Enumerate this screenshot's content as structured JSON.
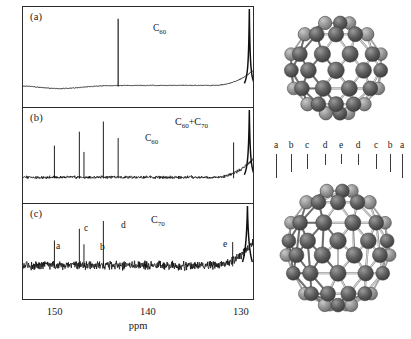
{
  "figure": {
    "caption_panels": [
      "(a)",
      "(b)",
      "(c)"
    ],
    "axis": {
      "label": "ppm",
      "ticks": [
        150,
        140,
        130
      ],
      "range_left_ppm": 153.5,
      "range_right_ppm": 128.6,
      "direction": "decreasing-left-to-right"
    }
  },
  "panels": [
    {
      "id": "a",
      "tag": "(a)",
      "species_label": "C",
      "species_sub": "60",
      "annotations": [
        {
          "text": "C",
          "sub": "60",
          "ppm": 143.2
        }
      ],
      "description": "Single sharp C60 resonance on flat baseline"
    },
    {
      "id": "b",
      "tag": "(b)",
      "species_label": "C",
      "species_sub": "60",
      "species_label2": "C",
      "species_sub2": "70",
      "annotations": [
        {
          "text": "C",
          "sub": "60",
          "ppm": 143.2
        }
      ],
      "description": "Mixture of C60 and C70 showing multiple resonances"
    },
    {
      "id": "c",
      "tag": "(c)",
      "species_label": "C",
      "species_sub": "70",
      "annotations": [
        {
          "text": "a",
          "ppm": 150.1
        },
        {
          "text": "c",
          "ppm": 147.4
        },
        {
          "text": "b",
          "ppm": 146.9
        },
        {
          "text": "d",
          "ppm": 144.8
        },
        {
          "text": "e",
          "ppm": 130.8
        }
      ],
      "description": "C70 spectrum with five inequivalent carbon sites a-e"
    }
  ],
  "chart_data": {
    "type": "line",
    "title": "",
    "xlabel": "ppm",
    "ylabel": "",
    "xlim": [
      153.5,
      128.6
    ],
    "grid": false,
    "legend": "none",
    "panels": [
      {
        "name": "(a) C60",
        "peaks": [
          {
            "ppm": 143.2,
            "height": 0.92,
            "label": "C60"
          },
          {
            "ppm": 129.0,
            "height": 1.0,
            "label": "solvent"
          }
        ],
        "baseline_noise": 0.03
      },
      {
        "name": "(b) C60+C70",
        "peaks": [
          {
            "ppm": 150.1,
            "height": 0.5,
            "label": "a"
          },
          {
            "ppm": 147.4,
            "height": 0.72,
            "label": "c"
          },
          {
            "ppm": 146.9,
            "height": 0.4,
            "label": "b"
          },
          {
            "ppm": 144.8,
            "height": 0.88,
            "label": "d"
          },
          {
            "ppm": 143.2,
            "height": 0.62,
            "label": "C60"
          },
          {
            "ppm": 130.7,
            "height": 0.55,
            "label": "e"
          },
          {
            "ppm": 129.0,
            "height": 1.0,
            "label": "solvent"
          }
        ],
        "baseline_noise": 0.1
      },
      {
        "name": "(c) C70",
        "peaks": [
          {
            "ppm": 150.1,
            "height": 0.45,
            "label": "a"
          },
          {
            "ppm": 147.4,
            "height": 0.66,
            "label": "c"
          },
          {
            "ppm": 146.9,
            "height": 0.38,
            "label": "b"
          },
          {
            "ppm": 144.8,
            "height": 0.8,
            "label": "d"
          },
          {
            "ppm": 130.8,
            "height": 0.42,
            "label": "e"
          },
          {
            "ppm": 129.2,
            "height": 1.0,
            "label": "solvent"
          }
        ],
        "baseline_noise": 0.22
      }
    ]
  },
  "molecules": {
    "top": {
      "name": "C60 fullerene",
      "shape": "truncated-icosahedron"
    },
    "bottom": {
      "name": "C70 fullerene",
      "shape": "elongated-fullerene",
      "site_labels": [
        "a",
        "b",
        "c",
        "d",
        "e",
        "d",
        "c",
        "b",
        "a"
      ]
    }
  },
  "colors": {
    "frame": "#2b2b2b",
    "trace": "#101010",
    "text": "#1a1a1a",
    "atom_front": "#585858",
    "atom_mid": "#8d8d8d",
    "atom_back": "#c2c2c2",
    "background": "#ffffff"
  }
}
